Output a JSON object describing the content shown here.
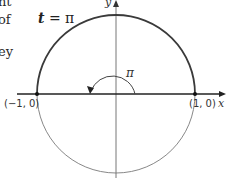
{
  "page_fragments": [
    "nt",
    "of",
    "ey"
  ],
  "labels": {
    "t_var": "t",
    "t_eq": " = π",
    "angle": "π",
    "left_point": "(−1, 0)",
    "right_point": "(1, 0)",
    "x_axis": "x",
    "y_axis": "y"
  },
  "colors": {
    "upper_arc": "#3a3a3a",
    "lower_arc": "#888888",
    "axis": "#222222"
  }
}
